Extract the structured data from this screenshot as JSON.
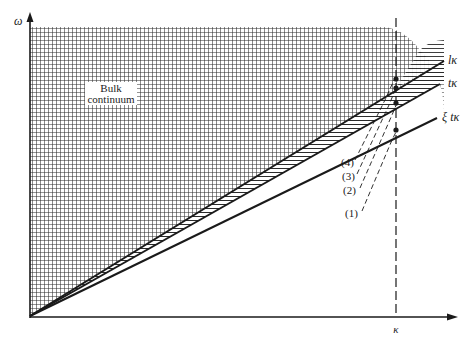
{
  "figure": {
    "axes": {
      "y_label": "ω",
      "x_label": "κ",
      "x_tick_label": "κ"
    },
    "regions": {
      "bulk_label_line1": "Bulk",
      "bulk_label_line2": "continuum"
    },
    "lines": [
      {
        "id": "l",
        "label": "lκ"
      },
      {
        "id": "t",
        "label": "tκ"
      },
      {
        "id": "xi",
        "label": "ξ tκ"
      }
    ],
    "branches": [
      {
        "label": "(4)"
      },
      {
        "label": "(3)"
      },
      {
        "label": "(2)"
      },
      {
        "label": "(1)"
      }
    ],
    "colors": {
      "ink": "#1a1a1a",
      "grid": "#2a2a2a",
      "background": "#ffffff"
    }
  }
}
